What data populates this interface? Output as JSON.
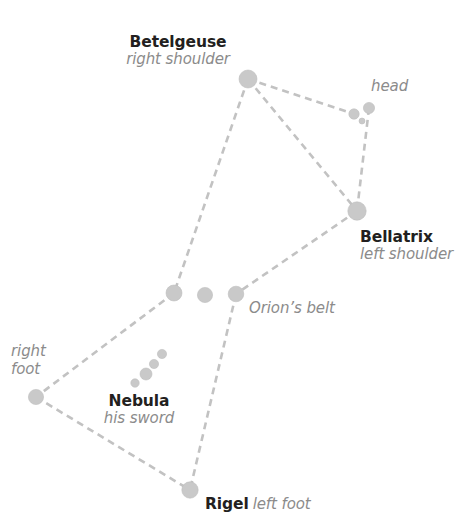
{
  "diagram": {
    "background_color": "#ffffff",
    "star_color": "#c9c9c9",
    "star_edge_color": "#bdbdbd",
    "line_color": "#c2c2c2",
    "name_text_color": "#231f20",
    "role_text_color": "#8b8b8b"
  },
  "labels": {
    "betelgeuse": {
      "name": "Betelgeuse",
      "role": "right shoulder"
    },
    "bellatrix": {
      "name": "Bellatrix",
      "role": "left shoulder"
    },
    "rigel": {
      "name": "Rigel",
      "role": "left foot"
    },
    "nebula": {
      "name": "Nebula",
      "role": "his sword"
    },
    "head": {
      "role": "head"
    },
    "belt": {
      "role": "Orion’s belt"
    },
    "right_foot": {
      "role_line1": "right",
      "role_line2": "foot"
    }
  },
  "chart_data": {
    "type": "scatter",
    "xlabel": "",
    "ylabel": "",
    "xlim": [
      0,
      458
    ],
    "ylim": [
      0,
      518
    ],
    "grid": false,
    "legend": "none",
    "coordinate_note": "pixel coordinates, origin top-left",
    "stars": [
      {
        "id": "betelgeuse",
        "label": "Betelgeuse",
        "x": 248,
        "y": 79,
        "r": 9.0
      },
      {
        "id": "head_left",
        "label": "head",
        "x": 354,
        "y": 114,
        "r": 5.2
      },
      {
        "id": "head_right",
        "label": "head",
        "x": 369,
        "y": 108,
        "r": 5.6
      },
      {
        "id": "head_small",
        "label": "head",
        "x": 362,
        "y": 121,
        "r": 3.0
      },
      {
        "id": "bellatrix",
        "label": "Bellatrix",
        "x": 357,
        "y": 211,
        "r": 9.2
      },
      {
        "id": "belt_right",
        "label": "Orion’s belt",
        "x": 174,
        "y": 293,
        "r": 8.0
      },
      {
        "id": "belt_mid",
        "label": "Orion’s belt",
        "x": 205,
        "y": 295,
        "r": 7.6
      },
      {
        "id": "belt_left",
        "label": "Orion’s belt",
        "x": 236,
        "y": 294,
        "r": 7.8
      },
      {
        "id": "sword_1",
        "label": "Nebula",
        "x": 135,
        "y": 383,
        "r": 4.2
      },
      {
        "id": "sword_2",
        "label": "Nebula",
        "x": 146,
        "y": 374,
        "r": 6.0
      },
      {
        "id": "sword_3",
        "label": "Nebula",
        "x": 154,
        "y": 364,
        "r": 4.6
      },
      {
        "id": "sword_4",
        "label": "Nebula",
        "x": 162,
        "y": 354,
        "r": 4.6
      },
      {
        "id": "right_foot",
        "label": "right foot",
        "x": 36,
        "y": 397,
        "r": 7.6
      },
      {
        "id": "rigel",
        "label": "Rigel",
        "x": 190,
        "y": 490,
        "r": 8.2
      }
    ],
    "connections": [
      {
        "from": "betelgeuse",
        "to": "head_left"
      },
      {
        "from": "betelgeuse",
        "to": "bellatrix"
      },
      {
        "from": "betelgeuse",
        "to": "belt_right"
      },
      {
        "from": "head_right",
        "to": "bellatrix"
      },
      {
        "from": "bellatrix",
        "to": "belt_left"
      },
      {
        "from": "belt_right",
        "to": "right_foot"
      },
      {
        "from": "right_foot",
        "to": "rigel"
      },
      {
        "from": "belt_left",
        "to": "rigel"
      }
    ],
    "line_style": {
      "dash": [
        7,
        5
      ],
      "width": 2.6,
      "color": "#c2c2c2"
    }
  }
}
